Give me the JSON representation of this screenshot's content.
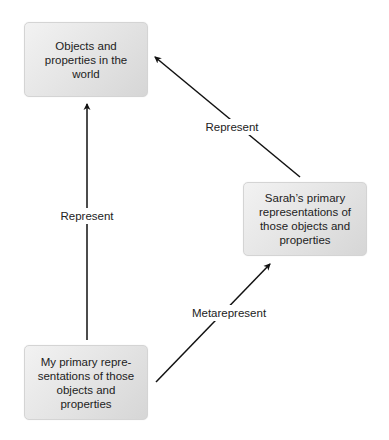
{
  "diagram": {
    "nodes": [
      {
        "id": "world",
        "lines": [
          "Objects and",
          "properties in the",
          "world"
        ]
      },
      {
        "id": "sarah",
        "lines": [
          "Sarah’s primary",
          "representations of",
          "those objects and",
          "properties"
        ]
      },
      {
        "id": "mine",
        "lines": [
          "My primary repre-",
          "sentations of those",
          "objects and",
          "properties"
        ]
      }
    ],
    "edges": [
      {
        "from": "mine",
        "to": "world",
        "label": "Represent"
      },
      {
        "from": "sarah",
        "to": "world",
        "label": "Represent"
      },
      {
        "from": "mine",
        "to": "sarah",
        "label": "Metarepresent"
      }
    ]
  },
  "colors": {
    "node_fill_light": "#f2f2f2",
    "node_fill_dark": "#d6d6d6",
    "node_border": "#d4d4d4",
    "arrow": "#111111",
    "text": "#222222"
  }
}
